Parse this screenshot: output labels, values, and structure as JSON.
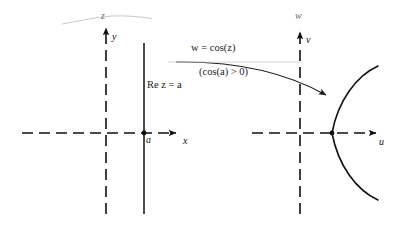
{
  "figure": {
    "type": "complex-mapping-diagram",
    "ink_color": "#111111",
    "background_color": "#ffffff"
  },
  "z_plane": {
    "plane_label": "z",
    "x_axis_label": "x",
    "y_axis_label": "y",
    "point_label": "a",
    "line_label": "Re z = a",
    "axis_style": "dashed",
    "line_style": "solid"
  },
  "w_plane": {
    "plane_label": "w",
    "u_axis_label": "u",
    "v_axis_label": "v",
    "axis_style": "dashed",
    "curve_style": "solid",
    "curve_name": "hyperbola-branch"
  },
  "mapping": {
    "equation": "w = cos(z)",
    "equation_w": "w",
    "equation_eq": "=",
    "equation_fn": "cos(",
    "equation_arg": "z",
    "equation_close": ")",
    "condition": "(cos(a) > 0)",
    "arrow_name": "mapping-arrow"
  }
}
